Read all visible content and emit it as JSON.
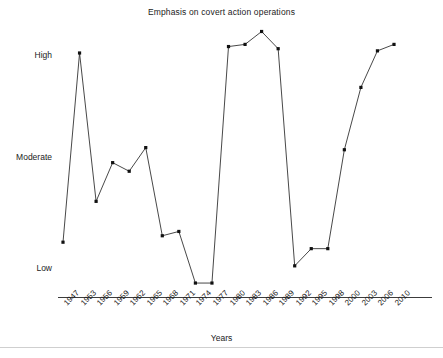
{
  "chart_data": {
    "type": "line",
    "title": "Emphasis on covert action operations",
    "xlabel": "Years",
    "ylabel": "",
    "grid": false,
    "legend": null,
    "marker": "square",
    "line_color": "#333333",
    "marker_color": "#111111",
    "categories": [
      "1947",
      "1953",
      "1956",
      "1959",
      "1962",
      "1965",
      "1968",
      "1971",
      "1974",
      "1977",
      "1980",
      "1983",
      "1986",
      "1989",
      "1992",
      "1995",
      "1998",
      "2000",
      "2003",
      "2006",
      "2010"
    ],
    "x": [
      "1947",
      "1953",
      "1956",
      "1959",
      "1962",
      "1965",
      "1968",
      "1971",
      "1974",
      "1977",
      "1980",
      "1983",
      "1986",
      "1989",
      "1992",
      "1995",
      "1998",
      "2000",
      "2003",
      "2006",
      "2010"
    ],
    "x_tick_labels": [
      "1947",
      "1953",
      "1956",
      "1959",
      "1962",
      "1965",
      "1968",
      "1971",
      "1974",
      "1977",
      "1980",
      "1983",
      "1986",
      "1989",
      "1992",
      "1995",
      "1998",
      "2000",
      "2003",
      "2006",
      "2010"
    ],
    "x_tick_rotation": -45,
    "ylim": [
      -10,
      112
    ],
    "y_tick_labels": [
      "High",
      "Moderate",
      "Low"
    ],
    "y_tick_values": [
      100,
      50,
      0
    ],
    "y_scale_note": "Ordinal scale: Low = 0, Moderate = 50, High = 100",
    "values": [
      12,
      100,
      31,
      49,
      45,
      56,
      15,
      17,
      -7,
      -7,
      103,
      104,
      110,
      102,
      1,
      null,
      9,
      55,
      84,
      101,
      104
    ],
    "points": [
      {
        "year": "1947",
        "value": 12,
        "level": "below Low"
      },
      {
        "year": "1953",
        "value": 100,
        "level": "High"
      },
      {
        "year": "1956",
        "value": 31,
        "level": "between Low and Moderate"
      },
      {
        "year": "1959",
        "value": 49,
        "level": "Moderate"
      },
      {
        "year": "1962",
        "value": 45,
        "level": "just below Moderate"
      },
      {
        "year": "1965",
        "value": 56,
        "level": "just above Moderate"
      },
      {
        "year": "1968",
        "value": 15,
        "level": "above Low"
      },
      {
        "year": "1971",
        "value": 17,
        "level": "above Low"
      },
      {
        "year": "1974",
        "value": -7,
        "level": "Low"
      },
      {
        "year": "1977",
        "value": -7,
        "level": "Low"
      },
      {
        "year": "1980",
        "value": 103,
        "level": "High"
      },
      {
        "year": "1983",
        "value": 104,
        "level": "High"
      },
      {
        "year": "1986",
        "value": 110,
        "level": "above High"
      },
      {
        "year": "1989",
        "value": 102,
        "level": "High"
      },
      {
        "year": "1992",
        "value": 1,
        "level": "Low"
      },
      {
        "year": "1995",
        "value": 9,
        "level": "just above Low"
      },
      {
        "year": "1998",
        "value": 9,
        "level": "just above Low"
      },
      {
        "year": "2000",
        "value": 55,
        "level": "Moderate"
      },
      {
        "year": "2003",
        "value": 84,
        "level": "between Moderate and High"
      },
      {
        "year": "2006",
        "value": 101,
        "level": "High"
      },
      {
        "year": "2010",
        "value": 104,
        "level": "High"
      }
    ],
    "pixel_points": [
      [
        63,
        241
      ],
      [
        80,
        53
      ],
      [
        98,
        202
      ],
      [
        131,
        162
      ],
      [
        149,
        172
      ],
      [
        169,
        148
      ],
      [
        191,
        237
      ],
      [
        208,
        232
      ],
      [
        229,
        282
      ],
      [
        239,
        282
      ],
      [
        247,
        47
      ],
      [
        265,
        36
      ],
      [
        285,
        51
      ],
      [
        316,
        265
      ],
      [
        362,
        249
      ],
      [
        364,
        145
      ],
      [
        377,
        85
      ],
      [
        386,
        50
      ],
      [
        394,
        48
      ]
    ]
  },
  "axis": {
    "y_labels": [
      {
        "text": "High",
        "top": 55
      },
      {
        "text": "Moderate",
        "top": 157
      },
      {
        "text": "Low",
        "top": 268
      }
    ],
    "x_title": "Years"
  },
  "colors": {
    "line": "#333333",
    "marker": "#111111",
    "axis": "#3c3c3c",
    "text": "#222222",
    "rule": "#cfcfcf",
    "background": "#ffffff"
  }
}
